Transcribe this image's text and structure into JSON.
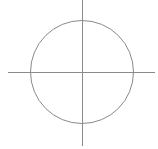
{
  "diagram": {
    "type": "circle-with-crosshair-axes",
    "stroke_color": "#8a8a8a",
    "background": "#ffffff",
    "circle": {
      "cx": 82,
      "cy": 72,
      "r": 51.5
    },
    "horizontal_axis": {
      "x1": 8,
      "y1": 72,
      "x2": 155,
      "y2": 72
    },
    "vertical_axis": {
      "x1": 82,
      "y1": 0,
      "x2": 82,
      "y2": 146
    }
  }
}
